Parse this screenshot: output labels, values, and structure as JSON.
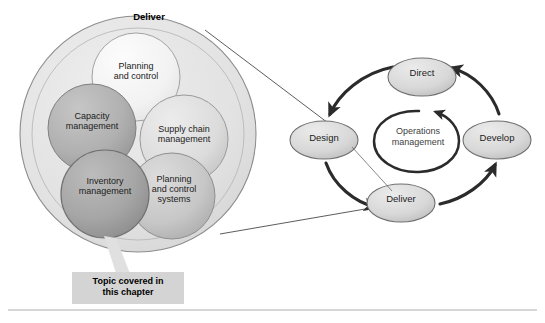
{
  "figure": {
    "title": "Deliver",
    "callout": "Topic covered in\nthis chapter",
    "magnified_circle": {
      "title": "Deliver",
      "inner_circles": [
        {
          "label": "Planning\nand control",
          "shade": "lightest"
        },
        {
          "label": "Capacity\nmanagement",
          "shade": "dark"
        },
        {
          "label": "Supply chain\nmanagement",
          "shade": "light"
        },
        {
          "label": "Inventory\nmanagement",
          "shade": "darkest"
        },
        {
          "label": "Planning\nand control\nsystems",
          "shade": "medium"
        }
      ]
    },
    "cycle": {
      "center_label": "Operations\nmanagement",
      "nodes": [
        {
          "name": "direct",
          "label": "Direct"
        },
        {
          "name": "design",
          "label": "Design"
        },
        {
          "name": "develop",
          "label": "Develop"
        },
        {
          "name": "deliver",
          "label": "Deliver"
        }
      ],
      "flow_order": [
        "Direct",
        "Design",
        "Deliver",
        "Develop",
        "Direct"
      ]
    },
    "colors": {
      "outer_circle_fill": "#e2e2e2",
      "lightest_fill": "#f4f4f4",
      "light_fill": "#dedede",
      "medium_fill": "#c9c9c9",
      "dark_fill": "#b2b2b2",
      "darkest_fill": "#a8a8a8",
      "ellipse_fill": "#d9d9d9",
      "stroke": "#5a5a5a",
      "arrow": "#2b2b2b",
      "callout_bg": "#d4d4d4",
      "divider": "#c8c8c8"
    }
  }
}
